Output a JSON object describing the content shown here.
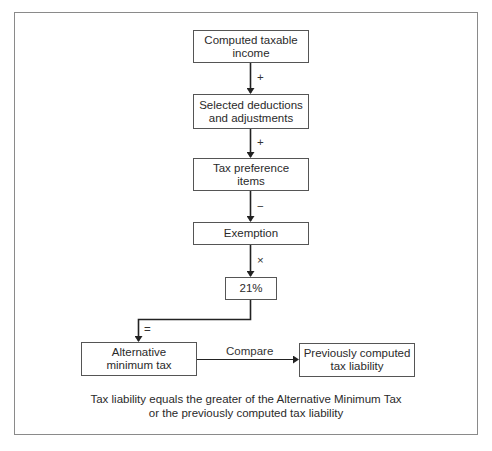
{
  "diagram": {
    "nodes": [
      {
        "id": "computed-taxable-income",
        "label": "Computed taxable income",
        "line1": "Computed taxable",
        "line2": "income"
      },
      {
        "id": "selected-deductions",
        "label": "Selected deductions and adjustments",
        "line1": "Selected deductions",
        "line2": "and adjustments"
      },
      {
        "id": "tax-preference-items",
        "label": "Tax preference items",
        "line1": "Tax preference",
        "line2": "items"
      },
      {
        "id": "exemption",
        "label": "Exemption",
        "line1": "Exemption"
      },
      {
        "id": "rate",
        "label": "21%",
        "line1": "21%"
      },
      {
        "id": "alternative-minimum-tax",
        "label": "Alternative minimum tax",
        "line1": "Alternative",
        "line2": "minimum tax"
      },
      {
        "id": "previously-computed-tax-liability",
        "label": "Previously computed tax liability",
        "line1": "Previously computed",
        "line2": "tax liability"
      }
    ],
    "edges": [
      {
        "from": "computed-taxable-income",
        "to": "selected-deductions",
        "label": "+"
      },
      {
        "from": "selected-deductions",
        "to": "tax-preference-items",
        "label": "+"
      },
      {
        "from": "tax-preference-items",
        "to": "exemption",
        "label": "−"
      },
      {
        "from": "exemption",
        "to": "rate",
        "label": "×"
      },
      {
        "from": "rate",
        "to": "alternative-minimum-tax",
        "label": "="
      },
      {
        "from": "alternative-minimum-tax",
        "to": "previously-computed-tax-liability",
        "label": "Compare"
      }
    ],
    "caption": {
      "line1": "Tax liability equals the greater of the Alternative Minimum Tax",
      "line2": "or the previously computed tax liability"
    }
  }
}
